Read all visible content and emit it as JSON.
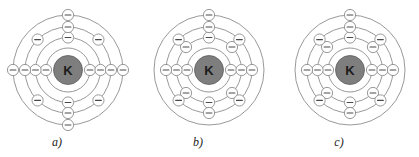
{
  "figure": {
    "background_color": "#ffffff",
    "width": 419,
    "height": 157
  },
  "style": {
    "ring_color": "#8d8d8d",
    "nucleus_fill": "#7e7e7e",
    "nucleus_stroke": "#5e5e5e",
    "nucleus_label_color": "#1c1c1c",
    "electron_fill": "#ffffff",
    "electron_stroke": "#8d8d8d",
    "electron_sign_color": "#4a4a4a",
    "label_color": "#1c1c1c"
  },
  "electron_symbol": "−",
  "shell_radii": [
    22,
    32.5,
    43,
    55
  ],
  "nucleus_radius": 14.5,
  "electron_radius": 5.6,
  "panels": [
    {
      "id": "a",
      "label": "a)",
      "nucleus_symbol": "K",
      "center_x": 68,
      "center_y": 70,
      "label_x": 57,
      "label_y": 146,
      "shells": [
        {
          "index": 1,
          "radius": 22,
          "electron_count": 2,
          "angles": [
            0,
            180
          ]
        },
        {
          "index": 2,
          "radius": 32.5,
          "electron_count": 4,
          "angles": [
            0,
            90,
            180,
            270
          ]
        },
        {
          "index": 3,
          "radius": 43,
          "electron_count": 8,
          "angles": [
            0,
            45,
            90,
            135,
            180,
            225,
            270,
            315
          ]
        },
        {
          "index": 4,
          "radius": 55,
          "electron_count": 4,
          "angles": [
            0,
            90,
            180,
            270
          ]
        }
      ],
      "shell_occupancy": [
        2,
        4,
        8,
        4
      ],
      "total_electrons": 18
    },
    {
      "id": "b",
      "label": "b)",
      "nucleus_symbol": "K",
      "center_x": 209,
      "center_y": 70,
      "label_x": 198,
      "label_y": 146,
      "shells": [
        {
          "index": 1,
          "radius": 22,
          "electron_count": 2,
          "angles": [
            0,
            180
          ]
        },
        {
          "index": 2,
          "radius": 32.5,
          "electron_count": 8,
          "angles": [
            0,
            45,
            90,
            135,
            180,
            225,
            270,
            315
          ]
        },
        {
          "index": 3,
          "radius": 43,
          "electron_count": 8,
          "angles": [
            0,
            45,
            90,
            135,
            180,
            225,
            270,
            315
          ]
        },
        {
          "index": 4,
          "radius": 55,
          "electron_count": 1,
          "angles": [
            90
          ]
        }
      ],
      "shell_occupancy": [
        2,
        8,
        8,
        1
      ],
      "total_electrons": 19
    },
    {
      "id": "c",
      "label": "c)",
      "nucleus_symbol": "K",
      "center_x": 350,
      "center_y": 70,
      "label_x": 339,
      "label_y": 146,
      "shells": [
        {
          "index": 1,
          "radius": 22,
          "electron_count": 2,
          "angles": [
            0,
            180
          ]
        },
        {
          "index": 2,
          "radius": 32.5,
          "electron_count": 8,
          "angles": [
            0,
            45,
            90,
            135,
            180,
            225,
            270,
            315
          ]
        },
        {
          "index": 3,
          "radius": 43,
          "electron_count": 8,
          "angles": [
            0,
            45,
            90,
            135,
            180,
            225,
            270,
            315
          ]
        },
        {
          "index": 4,
          "radius": 55,
          "electron_count": 1,
          "angles": [
            90
          ]
        }
      ],
      "shell_occupancy": [
        2,
        8,
        8,
        1
      ],
      "total_electrons": 19
    }
  ]
}
